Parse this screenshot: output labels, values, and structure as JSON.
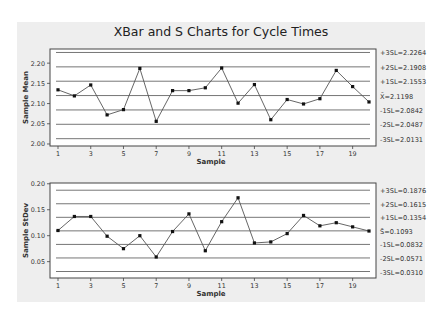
{
  "chart_data": [
    {
      "type": "line",
      "title": "XBar and S Charts for Cycle Times",
      "xlabel": "Sample",
      "ylabel": "Sample Mean",
      "x": [
        1,
        2,
        3,
        4,
        5,
        6,
        7,
        8,
        9,
        10,
        11,
        12,
        13,
        14,
        15,
        16,
        17,
        18,
        19,
        20
      ],
      "x_ticks": [
        "1",
        "3",
        "5",
        "7",
        "9",
        "11",
        "13",
        "15",
        "17",
        "19"
      ],
      "y_ticks": [
        "2.00",
        "2.05",
        "2.10",
        "2.15",
        "2.20"
      ],
      "ylim": [
        1.995,
        2.235
      ],
      "grid": false,
      "series": [
        {
          "name": "Sample Mean",
          "values": [
            2.134,
            2.119,
            2.146,
            2.072,
            2.085,
            2.187,
            2.056,
            2.132,
            2.132,
            2.139,
            2.188,
            2.101,
            2.147,
            2.06,
            2.11,
            2.099,
            2.112,
            2.182,
            2.142,
            2.104
          ]
        }
      ],
      "reference_lines": [
        {
          "label": "+3SL=2.2264",
          "value": 2.2264
        },
        {
          "label": "+2SL=2.1908",
          "value": 2.1908
        },
        {
          "label": "+1SL=2.1553",
          "value": 2.1553
        },
        {
          "label": "X̄=2.1198",
          "value": 2.1198
        },
        {
          "label": "-1SL=2.0842",
          "value": 2.0842
        },
        {
          "label": "-2SL=2.0487",
          "value": 2.0487
        },
        {
          "label": "-3SL=2.0131",
          "value": 2.0131
        }
      ]
    },
    {
      "type": "line",
      "title": "",
      "xlabel": "Sample",
      "ylabel": "Sample StDev",
      "x": [
        1,
        2,
        3,
        4,
        5,
        6,
        7,
        8,
        9,
        10,
        11,
        12,
        13,
        14,
        15,
        16,
        17,
        18,
        19,
        20
      ],
      "x_ticks": [
        "1",
        "3",
        "5",
        "7",
        "9",
        "11",
        "13",
        "15",
        "17",
        "19"
      ],
      "y_ticks": [
        "0.05",
        "0.10",
        "0.15",
        "0.20"
      ],
      "ylim": [
        0.0185,
        0.2015
      ],
      "grid": false,
      "series": [
        {
          "name": "Sample StDev",
          "values": [
            0.11,
            0.137,
            0.137,
            0.099,
            0.075,
            0.1,
            0.059,
            0.108,
            0.142,
            0.071,
            0.127,
            0.173,
            0.086,
            0.088,
            0.104,
            0.139,
            0.119,
            0.125,
            0.117,
            0.109
          ]
        }
      ],
      "reference_lines": [
        {
          "label": "+3SL=0.1876",
          "value": 0.1876
        },
        {
          "label": "+2SL=0.1615",
          "value": 0.1615
        },
        {
          "label": "+1SL=0.1354",
          "value": 0.1354
        },
        {
          "label": "S̄=0.1093",
          "value": 0.1093
        },
        {
          "label": "-1SL=0.0832",
          "value": 0.0832
        },
        {
          "label": "-2SL=0.0571",
          "value": 0.0571
        },
        {
          "label": "-3SL=0.0310",
          "value": 0.031
        }
      ]
    }
  ],
  "colors": {
    "panel_bg": "#eeeeee",
    "plot_bg": "#ffffff",
    "line": "#555555",
    "marker": "#111111",
    "ref_line": "#666666"
  }
}
